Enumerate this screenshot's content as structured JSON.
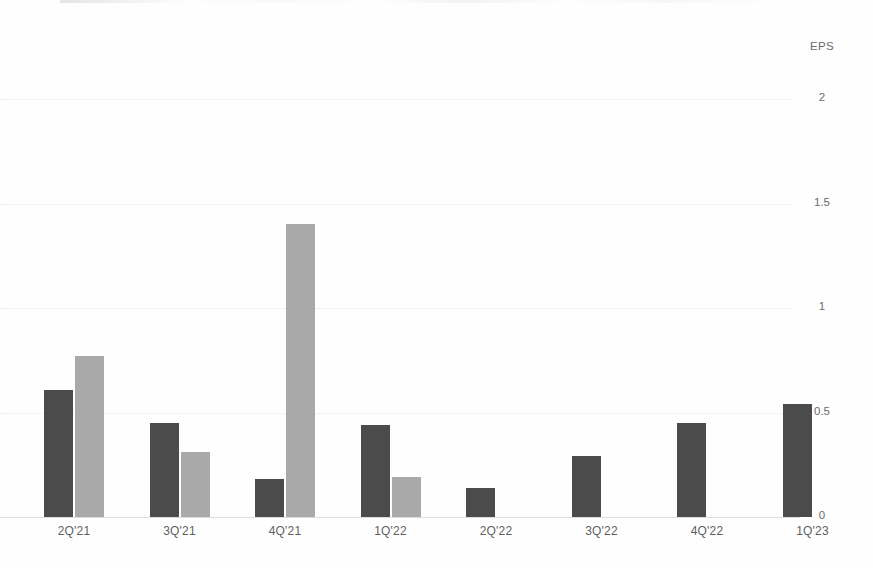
{
  "chart_data": {
    "type": "bar",
    "title": "",
    "subtitle": "",
    "xlabel": "",
    "ylabel": "EPS",
    "axis_title_position": "top-right",
    "categories": [
      "2Q'21",
      "3Q'21",
      "4Q'21",
      "1Q'22",
      "2Q'22",
      "3Q'22",
      "4Q'22",
      "1Q'23"
    ],
    "series": [
      {
        "name": "series-1-dark",
        "color": "#4b4b4b",
        "values": [
          0.61,
          0.45,
          0.18,
          0.44,
          0.14,
          0.29,
          0.45,
          0.54
        ]
      },
      {
        "name": "series-2-light",
        "color": "#a9a9a9",
        "values": [
          0.77,
          0.31,
          1.4,
          0.19,
          null,
          null,
          null,
          null
        ]
      }
    ],
    "ylim": [
      0,
      2
    ],
    "yticks": [
      0,
      0.5,
      1,
      1.5,
      2
    ],
    "ytick_labels": [
      "0",
      "0.5",
      "1",
      "1.5",
      "2"
    ],
    "grid": true,
    "grid_style": "dotted",
    "grid_color": "#e8e8e8",
    "legend": false,
    "legend_position": "none",
    "background": "#ffffff",
    "text_color": "#5e5e5e"
  }
}
